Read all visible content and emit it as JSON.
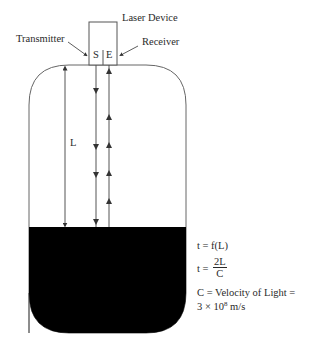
{
  "diagram": {
    "labels": {
      "laser_device": "Laser Device",
      "transmitter": "Transmitter",
      "receiver": "Receiver",
      "source_marker": "S",
      "emitter_marker": "E",
      "distance": "L"
    },
    "equations": {
      "eq1": "t = f(L)",
      "eq2_lhs": "t =",
      "eq2_num": "2L",
      "eq2_den": "C",
      "eq3_line1": "C = Velocity of Light =",
      "eq3_line2_pre": "3 × 10",
      "eq3_line2_exp": "8",
      "eq3_line2_post": " m/s"
    },
    "colors": {
      "line": "#555555",
      "liquid": "#000000",
      "background": "#ffffff"
    }
  }
}
